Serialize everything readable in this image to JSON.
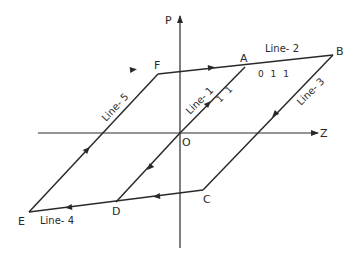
{
  "diagram": {
    "type": "polarization hysteresis loop schematic",
    "axes": {
      "vertical": "P",
      "horizontal": "Z",
      "origin": "O"
    },
    "points": {
      "A": "A",
      "B": "B",
      "C": "C",
      "D": "D",
      "E": "E",
      "F": "F",
      "O": "O"
    },
    "lines": [
      {
        "id": "line-1",
        "label": "Line- 1",
        "from": "O",
        "to": "A",
        "index": "1 1"
      },
      {
        "id": "line-2",
        "label": "Line- 2",
        "from": "F",
        "to": "B",
        "index": "0 1 1"
      },
      {
        "id": "line-3",
        "label": "Line- 3",
        "from": "B",
        "to": "C"
      },
      {
        "id": "line-4",
        "label": "Line- 4",
        "from": "C",
        "to": "E"
      },
      {
        "id": "line-5",
        "label": "Line- 5",
        "from": "E",
        "to": "F"
      }
    ],
    "colors": {
      "stroke": "#2a2a2a",
      "background": "#ffffff"
    }
  }
}
